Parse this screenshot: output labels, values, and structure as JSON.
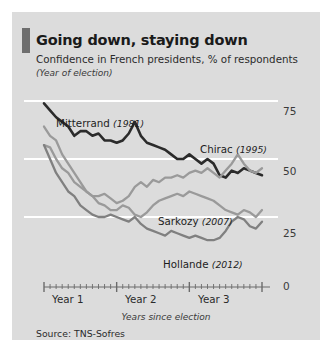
{
  "panel": {
    "title": "Going down, staying down",
    "subtitle": "Confidence in French presidents, % of respondents",
    "subtitle2": "(Year of election)",
    "source": "Source: TNS-Sofres",
    "accent_color": "#6e6e6e",
    "background_color": "#dcdcdc"
  },
  "chart_data": {
    "type": "line",
    "title": "Going down, staying down",
    "subtitle": "Confidence in French presidents, % of respondents",
    "xlabel": "Years since election",
    "ylabel": "",
    "ylim": [
      0,
      75
    ],
    "xlim": [
      0,
      36
    ],
    "yticks": [
      0,
      25,
      50,
      75
    ],
    "ytick_labels": [
      "0",
      "25",
      "50",
      "75"
    ],
    "xtick_labels": [
      "Year 1",
      "Year 2",
      "Year 3"
    ],
    "xtick_positions": [
      6,
      18,
      30
    ],
    "x_unit": "months since election",
    "grid": "horizontal-white",
    "legend": "inline-annotations",
    "series": [
      {
        "name": "Mitterrand",
        "label": "Mitterrand",
        "election_year": "(1981)",
        "color": "#2b2b2b",
        "x": [
          0,
          1,
          2,
          3,
          4,
          5,
          6,
          7,
          8,
          9,
          10,
          11,
          12,
          13,
          14,
          15,
          16,
          17,
          18,
          19,
          20,
          21,
          22,
          23,
          24,
          25,
          26,
          27,
          28,
          29,
          30,
          31,
          32,
          33,
          34,
          35,
          36
        ],
        "values": [
          74,
          71,
          68,
          66,
          64,
          60,
          62,
          62,
          60,
          61,
          58,
          58,
          57,
          58,
          61,
          66,
          60,
          57,
          56,
          55,
          54,
          52,
          50,
          50,
          52,
          50,
          48,
          50,
          48,
          43,
          42,
          45,
          44,
          46,
          45,
          44,
          43
        ]
      },
      {
        "name": "Chirac",
        "label": "Chirac",
        "election_year": "(1995)",
        "color": "#9a9a9a",
        "x": [
          0,
          1,
          2,
          3,
          4,
          5,
          6,
          7,
          8,
          9,
          10,
          11,
          12,
          13,
          14,
          15,
          16,
          17,
          18,
          19,
          20,
          21,
          22,
          23,
          24,
          25,
          26,
          27,
          28,
          29,
          30,
          31,
          32,
          33,
          34,
          35,
          36
        ],
        "values": [
          64,
          60,
          58,
          52,
          48,
          44,
          40,
          36,
          34,
          34,
          35,
          33,
          31,
          32,
          34,
          38,
          40,
          38,
          41,
          40,
          42,
          42,
          43,
          42,
          44,
          45,
          44,
          46,
          44,
          42,
          45,
          48,
          52,
          48,
          45,
          44,
          46
        ]
      },
      {
        "name": "Sarkozy",
        "label": "Sarkozy",
        "election_year": "(2007)",
        "color": "#9a9a9a",
        "x": [
          0,
          1,
          2,
          3,
          4,
          5,
          6,
          7,
          8,
          9,
          10,
          11,
          12,
          13,
          14,
          15,
          16,
          17,
          18,
          19,
          20,
          21,
          22,
          23,
          24,
          25,
          26,
          27,
          28,
          29,
          30,
          31,
          32,
          33,
          34,
          35,
          36
        ],
        "values": [
          56,
          55,
          50,
          46,
          44,
          40,
          38,
          36,
          34,
          31,
          30,
          28,
          28,
          30,
          29,
          26,
          25,
          27,
          30,
          32,
          33,
          34,
          35,
          34,
          36,
          35,
          34,
          33,
          32,
          30,
          28,
          27,
          26,
          28,
          27,
          25,
          28
        ]
      },
      {
        "name": "Hollande",
        "label": "Hollande",
        "election_year": "(2012)",
        "color": "#808080",
        "x": [
          0,
          1,
          2,
          3,
          4,
          5,
          6,
          7,
          8,
          9,
          10,
          11,
          12,
          13,
          14,
          15,
          16,
          17,
          18,
          19,
          20,
          21,
          22,
          23,
          24,
          25,
          26,
          27,
          28,
          29,
          30,
          31,
          32,
          33,
          34,
          35,
          36
        ],
        "values": [
          56,
          50,
          44,
          40,
          36,
          34,
          30,
          28,
          26,
          25,
          25,
          26,
          25,
          24,
          23,
          25,
          22,
          20,
          19,
          18,
          17,
          19,
          18,
          17,
          16,
          17,
          16,
          15,
          15,
          16,
          19,
          23,
          25,
          24,
          21,
          20,
          23
        ]
      }
    ]
  }
}
